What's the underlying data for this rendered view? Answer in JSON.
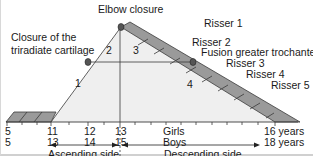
{
  "diagram": {
    "labels": {
      "elbow_closure": "Elbow closure",
      "triradiate": [
        "Closure of the",
        "triradiate cartilage"
      ],
      "fusion_trochanter": "Fusion greater trochanter",
      "risser": [
        "Risser 1",
        "Risser 2",
        "Risser 3",
        "Risser 4",
        "Risser 5"
      ]
    },
    "regions": [
      "1",
      "2",
      "3",
      "4"
    ],
    "axis": {
      "girls_label": "Girls",
      "boys_label": "Boys",
      "girls_ticks": [
        "5",
        "11",
        "12",
        "13",
        "16 years"
      ],
      "boys_ticks": [
        "5",
        "13",
        "14",
        "15",
        "18 years"
      ]
    },
    "sides": {
      "ascending": "Ascending side",
      "descending": "Descending side"
    },
    "colors": {
      "triangle_fill": "#efefef",
      "band_fill": "#9a9a9a",
      "line": "#3a3a3a",
      "dot": "#555555"
    }
  }
}
